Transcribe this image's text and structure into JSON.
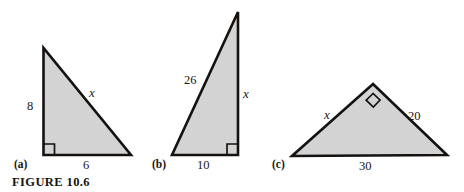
{
  "figure": {
    "caption": "FIGURE 10.6",
    "fill_color": "#d3d3d3",
    "stroke_color": "#14110f",
    "background": "#ffffff"
  },
  "panels": [
    {
      "key": "a",
      "label": "(a)",
      "shape": "right-triangle",
      "right_angle_at": "bottom-left",
      "sides": {
        "vertical": "8",
        "horizontal": "6",
        "hypotenuse": "x"
      },
      "labels": [
        {
          "name": "side-label-8",
          "text": "8",
          "italic": false
        },
        {
          "name": "side-label-x",
          "text": "x",
          "italic": true
        },
        {
          "name": "side-label-6",
          "text": "6",
          "italic": false
        }
      ]
    },
    {
      "key": "b",
      "label": "(b)",
      "shape": "right-triangle",
      "right_angle_at": "bottom-right",
      "sides": {
        "hypotenuse": "26",
        "horizontal": "10",
        "vertical": "x"
      },
      "labels": [
        {
          "name": "side-label-26",
          "text": "26",
          "italic": false
        },
        {
          "name": "side-label-x",
          "text": "x",
          "italic": true
        },
        {
          "name": "side-label-10",
          "text": "10",
          "italic": false
        }
      ]
    },
    {
      "key": "c",
      "label": "(c)",
      "shape": "right-triangle",
      "right_angle_at": "apex",
      "sides": {
        "left_leg": "x",
        "right_leg": "20",
        "hypotenuse": "30"
      },
      "labels": [
        {
          "name": "side-label-x",
          "text": "x",
          "italic": true
        },
        {
          "name": "side-label-20",
          "text": "20",
          "italic": false
        },
        {
          "name": "side-label-30",
          "text": "30",
          "italic": false
        }
      ]
    }
  ]
}
